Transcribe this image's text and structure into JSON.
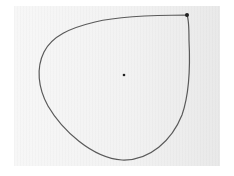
{
  "scene": {
    "description": "Hand-drawn closed teardrop-shaped loop with a pointed corner at the top right and a small dot in the center, on light gray paper",
    "colors": {
      "background": "#ffffff",
      "paper": "#f2f2f2",
      "stroke": "#555555",
      "corner_mark": "#222222",
      "dot": "#222222"
    },
    "shape": {
      "type": "teardrop-loop",
      "corner_point": [
        187,
        15
      ],
      "center_dot": [
        124,
        75
      ]
    }
  }
}
